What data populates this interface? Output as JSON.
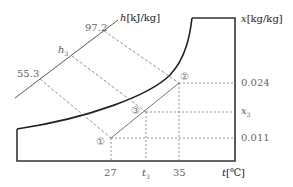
{
  "diagram": {
    "type": "psychrometric-chart-sketch",
    "axes": {
      "enthalpy": {
        "symbol": "h",
        "unit": "[kJ/kg]",
        "ticks": [
          "55.3",
          "h3",
          "97.2"
        ]
      },
      "humidity": {
        "symbol": "x",
        "unit": "[kg/kg]",
        "ticks": [
          "0.024",
          "x3",
          "0.011"
        ]
      },
      "temperature": {
        "symbol": "t",
        "unit": "[℃]",
        "ticks": [
          "27",
          "t3",
          "35"
        ]
      }
    },
    "labels": {
      "h_axis_symbol": "h",
      "h_axis_unit": "[kJ/kg]",
      "x_axis_symbol": "x",
      "x_axis_unit": "[kg/kg]",
      "t_axis_symbol": "t",
      "t_axis_unit": "[℃]",
      "h_97": "97.2",
      "h_3_symbol": "h",
      "h_3_sub": "3",
      "h_55": "55.3",
      "x_024": "0.024",
      "x_3_symbol": "x",
      "x_3_sub": "3",
      "x_011": "0.011",
      "t_27": "27",
      "t_3_symbol": "t",
      "t_3_sub": "3",
      "t_35": "35"
    },
    "points": [
      {
        "id": "1",
        "marker": "①",
        "t": "27",
        "x": "0.011",
        "h": "55.3"
      },
      {
        "id": "2",
        "marker": "②",
        "t": "35",
        "x": "0.024",
        "h": "97.2"
      },
      {
        "id": "3",
        "marker": "③",
        "t": "t3",
        "x": "x3",
        "h": "h3"
      }
    ],
    "mixing_line": "①–③–②"
  }
}
